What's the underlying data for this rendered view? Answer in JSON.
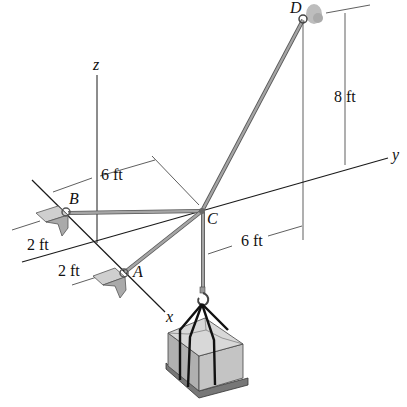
{
  "diagram": {
    "type": "3D statics diagram - crate suspended by three cables",
    "points": {
      "A": "A",
      "B": "B",
      "C": "C",
      "D": "D"
    },
    "axes": {
      "x": "x",
      "y": "y",
      "z": "z"
    },
    "dimensions": {
      "height_D": "8 ft",
      "offset_B_to_C": "6 ft",
      "offset_C_to_D": "6 ft",
      "anchor_B_offset": "2 ft",
      "anchor_A_offset": "2 ft"
    },
    "colors": {
      "line": "#1a1a1a",
      "cable": "#8a8a8a",
      "crate_top": "#d6d6d6",
      "crate_side": "#b4b4b4",
      "crate_front": "#c4c4c4",
      "anchor": "#c8c8c8",
      "wall": "#bdbdbd"
    }
  }
}
